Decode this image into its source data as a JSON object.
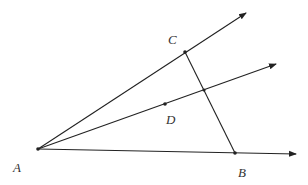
{
  "diagram": {
    "type": "geometry",
    "background": "#ffffff",
    "stroke_color": "#222222",
    "points": {
      "A": {
        "label": "A",
        "x": 38,
        "y": 149,
        "label_x": 13,
        "label_y": 172
      },
      "B": {
        "label": "B",
        "x": 235,
        "y": 153,
        "label_x": 238,
        "label_y": 177
      },
      "C": {
        "label": "C",
        "x": 185,
        "y": 52,
        "label_x": 168,
        "label_y": 44
      },
      "D": {
        "label": "D",
        "x": 165,
        "y": 104,
        "label_x": 166,
        "label_y": 124
      }
    },
    "intersection": {
      "x": 204,
      "y": 90
    },
    "rays": [
      {
        "name": "ray-AC",
        "from": "A",
        "end_x": 246,
        "end_y": 13
      },
      {
        "name": "ray-AD",
        "from": "A",
        "end_x": 276,
        "end_y": 64
      },
      {
        "name": "ray-AB",
        "from": "A",
        "end_x": 296,
        "end_y": 154
      }
    ],
    "segments": [
      {
        "name": "segment-CB",
        "from": "C",
        "to": "B"
      }
    ]
  }
}
